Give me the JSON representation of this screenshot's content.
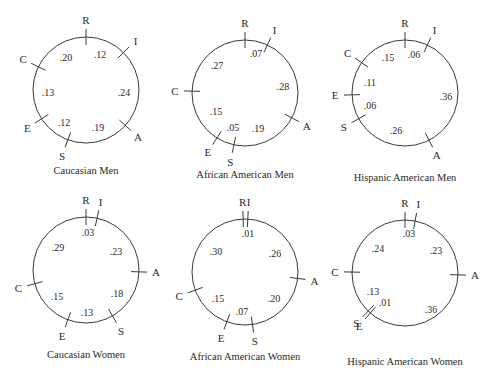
{
  "figure": {
    "caption_fragment": "...  Circular Unidimensional Scaling (RIASEC) solutions",
    "panels": [
      {
        "title": "Caucasian Men",
        "center": [
          86,
          90
        ],
        "radius": 53,
        "ticks": [
          {
            "label": "R",
            "angle": 0
          },
          {
            "label": "I",
            "angle": 45
          },
          {
            "label": "A",
            "angle": 132
          },
          {
            "label": "S",
            "angle": 200
          },
          {
            "label": "E",
            "angle": 237
          },
          {
            "label": "C",
            "angle": 296
          }
        ],
        "values": [
          {
            "text": ".12",
            "x": 100,
            "y": 58
          },
          {
            "text": ".20",
            "x": 66,
            "y": 61
          },
          {
            "text": ".13",
            "x": 48,
            "y": 96
          },
          {
            "text": ".24",
            "x": 124,
            "y": 96
          },
          {
            "text": ".12",
            "x": 64,
            "y": 126
          },
          {
            "text": ".19",
            "x": 98,
            "y": 131
          }
        ],
        "caption_pos": [
          86,
          174
        ]
      },
      {
        "title": "African American Men",
        "center": [
          245,
          93
        ],
        "radius": 53,
        "ticks": [
          {
            "label": "R",
            "angle": 0
          },
          {
            "label": "I",
            "angle": 25
          },
          {
            "label": "A",
            "angle": 118
          },
          {
            "label": "S",
            "angle": 192
          },
          {
            "label": "E",
            "angle": 212
          },
          {
            "label": "C",
            "angle": 272
          }
        ],
        "values": [
          {
            "text": ".07",
            "x": 256,
            "y": 57
          },
          {
            "text": ".27",
            "x": 217,
            "y": 69
          },
          {
            "text": ".28",
            "x": 283,
            "y": 90
          },
          {
            "text": ".15",
            "x": 216,
            "y": 115
          },
          {
            "text": ".05",
            "x": 233,
            "y": 131
          },
          {
            "text": ".19",
            "x": 258,
            "y": 132
          }
        ],
        "caption_pos": [
          245,
          178
        ]
      },
      {
        "title": "Hispanic American Men",
        "center": [
          405,
          93
        ],
        "radius": 53,
        "ticks": [
          {
            "label": "R",
            "angle": 0
          },
          {
            "label": "I",
            "angle": 25
          },
          {
            "label": "A",
            "angle": 153
          },
          {
            "label": "S",
            "angle": 241
          },
          {
            "label": "E",
            "angle": 268
          },
          {
            "label": "C",
            "angle": 305
          }
        ],
        "values": [
          {
            "text": ".15",
            "x": 388,
            "y": 61
          },
          {
            "text": ".06",
            "x": 414,
            "y": 58
          },
          {
            "text": ".11",
            "x": 370,
            "y": 86
          },
          {
            "text": ".36",
            "x": 446,
            "y": 100
          },
          {
            "text": ".06",
            "x": 370,
            "y": 109
          },
          {
            "text": ".26",
            "x": 396,
            "y": 134
          }
        ],
        "caption_pos": [
          405,
          181
        ]
      },
      {
        "title": "Caucasian Women",
        "center": [
          86,
          270
        ],
        "radius": 53,
        "ticks": [
          {
            "label": "R",
            "angle": 0
          },
          {
            "label": "I",
            "angle": 12
          },
          {
            "label": "A",
            "angle": 92
          },
          {
            "label": "S",
            "angle": 150
          },
          {
            "label": "E",
            "angle": 200
          },
          {
            "label": "C",
            "angle": 255
          }
        ],
        "values": [
          {
            "text": ".03",
            "x": 88,
            "y": 236
          },
          {
            "text": ".29",
            "x": 58,
            "y": 251
          },
          {
            "text": ".23",
            "x": 116,
            "y": 255
          },
          {
            "text": ".18",
            "x": 117,
            "y": 297
          },
          {
            "text": ".15",
            "x": 57,
            "y": 300
          },
          {
            "text": ".13",
            "x": 87,
            "y": 316
          }
        ],
        "caption_pos": [
          86,
          358
        ]
      },
      {
        "title": "African American Women",
        "center": [
          245,
          272
        ],
        "radius": 53,
        "ticks": [
          {
            "label": "R",
            "angle": -2
          },
          {
            "label": "I",
            "angle": 3
          },
          {
            "label": "A",
            "angle": 97
          },
          {
            "label": "S",
            "angle": 172
          },
          {
            "label": "E",
            "angle": 200
          },
          {
            "label": "C",
            "angle": 250
          }
        ],
        "values": [
          {
            "text": ".01",
            "x": 248,
            "y": 237
          },
          {
            "text": ".30",
            "x": 216,
            "y": 255
          },
          {
            "text": ".26",
            "x": 275,
            "y": 257
          },
          {
            "text": ".15",
            "x": 218,
            "y": 302
          },
          {
            "text": ".20",
            "x": 274,
            "y": 302
          },
          {
            "text": ".07",
            "x": 242,
            "y": 315
          }
        ],
        "caption_pos": [
          245,
          360
        ]
      },
      {
        "title": "Hispanic American Women",
        "center": [
          405,
          273
        ],
        "radius": 53,
        "ticks": [
          {
            "label": "R",
            "angle": 0
          },
          {
            "label": "I",
            "angle": 11
          },
          {
            "label": "A",
            "angle": 92
          },
          {
            "label": "S",
            "angle": 224
          },
          {
            "label": "E",
            "angle": 221
          },
          {
            "label": "C",
            "angle": 271
          }
        ],
        "values": [
          {
            "text": ".03",
            "x": 409,
            "y": 237
          },
          {
            "text": ".24",
            "x": 378,
            "y": 252
          },
          {
            "text": ".23",
            "x": 436,
            "y": 254
          },
          {
            "text": ".13",
            "x": 373,
            "y": 295
          },
          {
            "text": ".01",
            "x": 385,
            "y": 306
          },
          {
            "text": ".36",
            "x": 431,
            "y": 313
          }
        ],
        "caption_pos": [
          405,
          365
        ]
      }
    ]
  }
}
